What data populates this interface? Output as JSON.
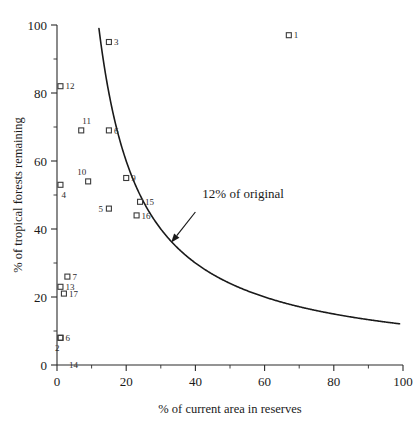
{
  "chart_data": {
    "type": "scatter",
    "title": "",
    "xlabel": "% of current area in reserves",
    "ylabel": "% of tropical forests remaining",
    "xlim": [
      0,
      100
    ],
    "ylim": [
      0,
      100
    ],
    "grid": false,
    "legend": "none",
    "x_ticks": [
      "0",
      "20",
      "40",
      "60",
      "80",
      "100"
    ],
    "x_tick_values": [
      0,
      20,
      40,
      60,
      80,
      100
    ],
    "x_minor_tick_values": [
      10,
      30,
      50,
      70,
      90
    ],
    "y_ticks": [
      "0",
      "20",
      "40",
      "60",
      "80",
      "100"
    ],
    "y_tick_values": [
      0,
      20,
      40,
      60,
      80,
      100
    ],
    "y_minor_tick_values": [
      10,
      30,
      50,
      70,
      90
    ],
    "marker_style": "open-square",
    "points": [
      {
        "label": "1",
        "x": 67,
        "y": 97,
        "label_pos": "right"
      },
      {
        "label": "3",
        "x": 15,
        "y": 95,
        "label_pos": "right"
      },
      {
        "label": "12",
        "x": 1,
        "y": 82,
        "label_pos": "right"
      },
      {
        "label": "11",
        "x": 7,
        "y": 69,
        "label_pos": "above-right"
      },
      {
        "label": "6",
        "x": 15,
        "y": 69,
        "label_pos": "right"
      },
      {
        "label": "10",
        "x": 9,
        "y": 54,
        "label_pos": "above-left"
      },
      {
        "label": "4",
        "x": 1,
        "y": 53,
        "label_pos": "below-right"
      },
      {
        "label": "9",
        "x": 20,
        "y": 55,
        "label_pos": "right"
      },
      {
        "label": "15",
        "x": 24,
        "y": 48,
        "label_pos": "right"
      },
      {
        "label": "16",
        "x": 23,
        "y": 44,
        "label_pos": "right"
      },
      {
        "label": "5",
        "x": 15,
        "y": 46,
        "label_pos": "left"
      },
      {
        "label": "7",
        "x": 3,
        "y": 26,
        "label_pos": "right"
      },
      {
        "label": "13",
        "x": 1,
        "y": 23,
        "label_pos": "right"
      },
      {
        "label": "17",
        "x": 2,
        "y": 21,
        "label_pos": "right"
      },
      {
        "label": "6",
        "x": 1,
        "y": 8,
        "label_pos": "right"
      },
      {
        "label": "2",
        "x": 1,
        "y": 8,
        "label_pos": "below-left"
      },
      {
        "label": "14",
        "x": 2,
        "y": 0,
        "label_pos": "right"
      }
    ],
    "curve": {
      "name": "12% of original",
      "formula": "y = 1200 / x",
      "x_start": 11.5,
      "x_end": 99,
      "annotation": {
        "text": "12% of original",
        "text_x": 42,
        "text_y": 49,
        "arrow_from_x": 40,
        "arrow_from_y": 45,
        "arrow_to_x": 33,
        "arrow_to_y": 36
      }
    }
  }
}
